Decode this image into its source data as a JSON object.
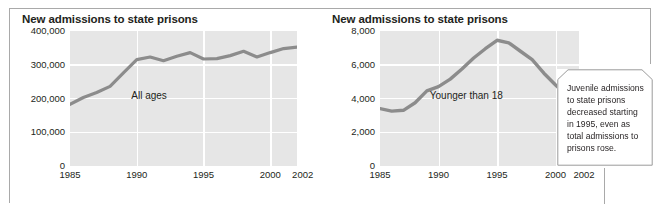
{
  "figure": {
    "callout": {
      "text": "Juvenile admissions to state prisons decreased starting in 1995, even as total admissions to prisons rose."
    }
  },
  "chart_data": [
    {
      "type": "line",
      "id": "all-ages",
      "title": "New admissions to state prisons",
      "xlabel": "",
      "ylabel": "",
      "grid": true,
      "legend": "inline-annotation",
      "series_label": "All ages",
      "xlim": [
        1985,
        2002
      ],
      "ylim": [
        0,
        400000
      ],
      "ytick_labels": [
        "400,000",
        "300,000",
        "200,000",
        "100,000",
        "0"
      ],
      "yticks": [
        400000,
        300000,
        200000,
        100000,
        0
      ],
      "xtick_labels": [
        "1985",
        "1990",
        "1995",
        "2000",
        "2002"
      ],
      "xticks": [
        1985,
        1990,
        1995,
        2000,
        2002
      ],
      "x": [
        1985,
        1986,
        1987,
        1988,
        1989,
        1990,
        1991,
        1992,
        1993,
        1994,
        1995,
        1996,
        1997,
        1998,
        1999,
        2000,
        2001,
        2002
      ],
      "values": [
        183000,
        203000,
        218000,
        236000,
        276000,
        315000,
        323000,
        312000,
        325000,
        336000,
        317000,
        318000,
        327000,
        340000,
        323000,
        336000,
        348000,
        352000
      ],
      "series": [
        {
          "name": "All ages",
          "values": [
            183000,
            203000,
            218000,
            236000,
            276000,
            315000,
            323000,
            312000,
            325000,
            336000,
            317000,
            318000,
            327000,
            340000,
            323000,
            336000,
            348000,
            352000
          ]
        }
      ],
      "line_color": "#8c8c8c",
      "plot_bg": "#e6e6e6"
    },
    {
      "type": "line",
      "id": "younger-than-18",
      "title": "New admissions to state prisons",
      "xlabel": "",
      "ylabel": "",
      "grid": true,
      "legend": "inline-annotation",
      "series_label": "Younger than 18",
      "xlim": [
        1985,
        2002
      ],
      "ylim": [
        0,
        8000
      ],
      "ytick_labels": [
        "8,000",
        "6,000",
        "4,000",
        "2,000",
        "0"
      ],
      "yticks": [
        8000,
        6000,
        4000,
        2000,
        0
      ],
      "xtick_labels": [
        "1985",
        "1990",
        "1995",
        "2000",
        "2002"
      ],
      "xticks": [
        1985,
        1990,
        1995,
        2000,
        2002
      ],
      "x": [
        1985,
        1986,
        1987,
        1988,
        1989,
        1990,
        1991,
        1992,
        1993,
        1994,
        1995,
        1996,
        1997,
        1998,
        1999,
        2000,
        2001,
        2002
      ],
      "values": [
        3400,
        3250,
        3300,
        3750,
        4450,
        4700,
        5150,
        5750,
        6400,
        6950,
        7450,
        7300,
        6800,
        6300,
        5500,
        4800,
        4150,
        4150
      ],
      "series": [
        {
          "name": "Younger than 18",
          "values": [
            3400,
            3250,
            3300,
            3750,
            4450,
            4700,
            5150,
            5750,
            6400,
            6950,
            7450,
            7300,
            6800,
            6300,
            5500,
            4800,
            4150,
            4150
          ]
        }
      ],
      "line_color": "#8c8c8c",
      "plot_bg": "#e6e6e6"
    }
  ]
}
